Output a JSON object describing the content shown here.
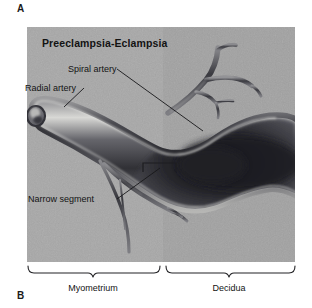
{
  "figure": {
    "panel_a_letter": "A",
    "panel_b_letter": "B",
    "title": "Preeclampsia-Eclampsia",
    "labels": {
      "spiral_artery": "Spiral artery",
      "radial_artery": "Radial artery",
      "narrow_segment": "Narrow segment"
    },
    "regions": {
      "left": "Myometrium",
      "right": "Decidua"
    },
    "colors": {
      "myometrium_background": "#a9a9a9",
      "decidua_background": "#9d9d9d",
      "vessel_wall": "#55555a",
      "vessel_lumen_dark": "#2a2a2e",
      "vessel_highlight": "#d8d8d6",
      "text": "#131313",
      "page_background": "#ffffff"
    }
  }
}
